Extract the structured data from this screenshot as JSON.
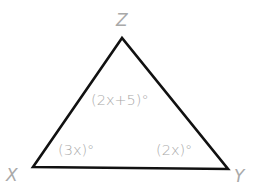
{
  "diagram": {
    "type": "triangle",
    "stroke_color": "#111111",
    "label_color": "#a9a9a9",
    "vertices": {
      "Z": {
        "label": "Z",
        "x": 122,
        "y": 38
      },
      "X": {
        "label": "X",
        "x": 33,
        "y": 167
      },
      "Y": {
        "label": "Y",
        "x": 228,
        "y": 169
      }
    },
    "angles": {
      "Z": "(2x+5)°",
      "X": "(3x)°",
      "Y": "(2x)°"
    }
  }
}
